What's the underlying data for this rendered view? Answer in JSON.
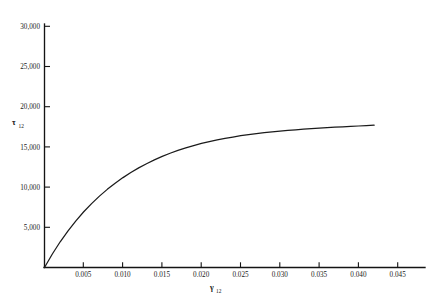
{
  "chart_data": {
    "type": "line",
    "title": "",
    "subtitle": "",
    "xlabel": "γ",
    "xlabel_sub": "12",
    "ylabel": "τ",
    "ylabel_sub": "12",
    "xlim": [
      0,
      0.0485
    ],
    "ylim": [
      0,
      31000
    ],
    "grid": false,
    "legend": "none",
    "x_ticks": [
      0.005,
      0.01,
      0.015,
      0.02,
      0.025,
      0.03,
      0.035,
      0.04,
      0.045
    ],
    "x_tick_labels": [
      "0.005",
      "0.010",
      "0.015",
      "0.020",
      "0.025",
      "0.030",
      "0.035",
      "0.040",
      "0.045"
    ],
    "y_ticks": [
      5000,
      10000,
      15000,
      20000,
      25000,
      30000
    ],
    "y_tick_labels": [
      "5,000",
      "10,000",
      "15,000",
      "20,000",
      "25,000",
      "30,000"
    ],
    "series": [
      {
        "name": "shear stress-strain",
        "color": "#1b1b1b",
        "x": [
          0.0,
          0.001,
          0.002,
          0.003,
          0.004,
          0.005,
          0.006,
          0.007,
          0.008,
          0.009,
          0.01,
          0.011,
          0.012,
          0.013,
          0.014,
          0.015,
          0.016,
          0.017,
          0.018,
          0.019,
          0.02,
          0.021,
          0.022,
          0.023,
          0.024,
          0.025,
          0.026,
          0.027,
          0.028,
          0.029,
          0.03,
          0.031,
          0.032,
          0.033,
          0.034,
          0.035,
          0.036,
          0.037,
          0.038,
          0.039,
          0.04,
          0.041,
          0.042
        ],
        "y": [
          0,
          1680,
          3200,
          4560,
          5800,
          6930,
          7950,
          8880,
          9720,
          10480,
          11180,
          11810,
          12390,
          12910,
          13390,
          13820,
          14210,
          14560,
          14880,
          15170,
          15430,
          15660,
          15870,
          16060,
          16230,
          16390,
          16530,
          16650,
          16770,
          16870,
          16960,
          17050,
          17130,
          17200,
          17270,
          17330,
          17390,
          17450,
          17500,
          17550,
          17600,
          17650,
          17700
        ]
      }
    ]
  },
  "axes": {
    "x_axis_name": "gamma-12-shear-strain",
    "y_axis_name": "tau-12-shear-stress"
  }
}
